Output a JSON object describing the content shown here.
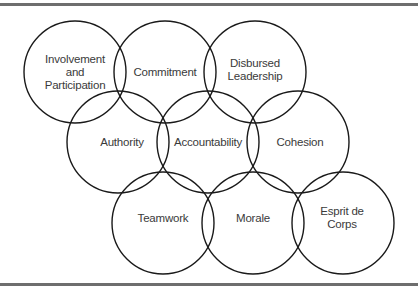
{
  "diagram": {
    "type": "overlapping-circles",
    "stroke_color": "#1a1a1a",
    "text_color": "#3a3a3a",
    "rule_color": "#6e6e6e",
    "radius": 51,
    "nodes": [
      {
        "label": "Involvement\nand\nParticipation",
        "cx": 75,
        "cy": 72
      },
      {
        "label": "Commitment",
        "cx": 165,
        "cy": 72
      },
      {
        "label": "Disbursed\nLeadership",
        "cx": 255,
        "cy": 72
      },
      {
        "label": "Authority",
        "cx": 118,
        "cy": 142
      },
      {
        "label": "Accountability",
        "cx": 208,
        "cy": 142
      },
      {
        "label": "Cohesion",
        "cx": 298,
        "cy": 142
      },
      {
        "label": "Teamwork",
        "cx": 163,
        "cy": 223
      },
      {
        "label": "Morale",
        "cx": 253,
        "cy": 223
      },
      {
        "label": "Esprit de Corps",
        "cx": 343,
        "cy": 223
      }
    ]
  }
}
